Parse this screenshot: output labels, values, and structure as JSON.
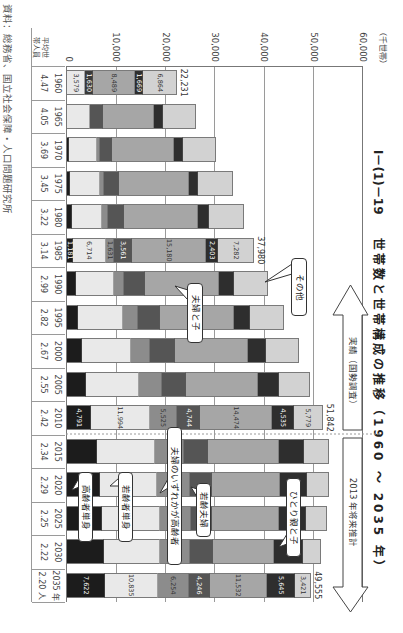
{
  "title": {
    "number": "Ⅰ－(1)－19",
    "text": "世帯数と世帯構成の推移（1960 ～ 2035 年）"
  },
  "axis": {
    "unit": "（千世帯）",
    "ticks": [
      "60,000",
      "50,000",
      "40,000",
      "30,000",
      "20,000",
      "10,000",
      "0"
    ]
  },
  "periods": {
    "actual": "実績（国勢調査）",
    "projection": "2013 年将来推計"
  },
  "callouts": {
    "other": "その他",
    "couple_with_children": "夫婦と子",
    "either_elderly_couple": "夫婦のいずれかが高齢者",
    "young_single": "若齢者単身",
    "young_couple": "若齢夫婦",
    "single_parent": "ひとり親と子",
    "elderly_single": "高齢者単身"
  },
  "table": {
    "header_line1": "平均世",
    "header_line2": "帯人員",
    "years": [
      "1960",
      "1965",
      "1970",
      "1975",
      "1980",
      "1985",
      "1990",
      "1995",
      "2000",
      "2005",
      "2010",
      "2015",
      "2020",
      "2025",
      "2030",
      "2035 年"
    ],
    "avg_size": [
      "4.47",
      "4.05",
      "3.69",
      "3.45",
      "3.22",
      "3.14",
      "2.99",
      "2.82",
      "2.67",
      "2.55",
      "2.42",
      "2.34",
      "2.29",
      "2.25",
      "2.22",
      "2.20 人"
    ]
  },
  "source": "資料：総務省、国立社会保障・人口問題研究所",
  "chart_data": {
    "type": "bar",
    "stacked": true,
    "title": "Ⅰ－(1)－19 世帯数と世帯構成の推移（1960 ～ 2035 年）",
    "xlabel": "",
    "ylabel": "千世帯",
    "ylim": [
      0,
      60000
    ],
    "yticks": [
      0,
      10000,
      20000,
      30000,
      40000,
      50000,
      60000
    ],
    "grid": true,
    "categories": [
      "1960",
      "1965",
      "1970",
      "1975",
      "1980",
      "1985",
      "1990",
      "1995",
      "2000",
      "2005",
      "2010",
      "2015",
      "2020",
      "2025",
      "2030",
      "2035"
    ],
    "series": [
      {
        "name": "高齢者単身",
        "color": "#1c1c1c",
        "values": [
          null,
          null,
          470,
          680,
          1010,
          1181,
          1760,
          2230,
          3110,
          3920,
          4791,
          6080,
          6760,
          7100,
          7440,
          7622
        ]
      },
      {
        "name": "若齢者単身",
        "color": "#e9e9e9",
        "values": [
          null,
          null,
          5610,
          5950,
          6080,
          6714,
          7710,
          9060,
          9800,
          10610,
          11994,
          11830,
          11490,
          11700,
          11360,
          10835
        ]
      },
      {
        "name": "夫婦のいずれかが高齢者",
        "color": "#8c8c8c",
        "values": [
          null,
          null,
          680,
          810,
          1280,
          1631,
          2160,
          3040,
          3990,
          4730,
          5525,
          5750,
          6620,
          6420,
          6220,
          6254
        ]
      },
      {
        "name": "若齢夫婦",
        "color": "#555555",
        "values": [
          null,
          null,
          2370,
          3110,
          3180,
          3561,
          4260,
          4600,
          5000,
          4930,
          4744,
          4930,
          4530,
          4190,
          4600,
          4246
        ]
      },
      {
        "name": "夫婦と子",
        "color": "#a6a6a6",
        "values": [
          8489,
          10480,
          12500,
          14200,
          15080,
          15180,
          14940,
          15010,
          14800,
          14600,
          14474,
          14330,
          13860,
          13650,
          12370,
          11532
        ]
      },
      {
        "name": "ひとり親と子",
        "color": "#2e2e2e",
        "values": [
          1669,
          1690,
          1830,
          1890,
          2160,
          2403,
          2970,
          3180,
          3720,
          4260,
          4535,
          5140,
          5410,
          5480,
          5810,
          5645
        ]
      },
      {
        "name": "その他",
        "color": "#d2d2d2",
        "values": [
          6864,
          6830,
          6760,
          6960,
          7030,
          7282,
          6960,
          6900,
          6620,
          6220,
          5779,
          5000,
          4460,
          4190,
          3720,
          3421
        ]
      }
    ],
    "early_segments": {
      "1960": [
        {
          "value": 3579,
          "color": "#e9e9e9"
        },
        {
          "value": 1630,
          "color": "#3a3a3a"
        }
      ],
      "1965": [
        {
          "value": 4730,
          "color": "#e9e9e9"
        },
        {
          "value": 2500,
          "color": "#555555"
        }
      ]
    },
    "labeled_years": [
      "1960",
      "1985",
      "2010",
      "2035"
    ],
    "totals": {
      "1960": "22,231",
      "1985": "37,980",
      "2010": "51,842",
      "2035": "49,555"
    },
    "avg_household_size": [
      4.47,
      4.05,
      3.69,
      3.45,
      3.22,
      3.14,
      2.99,
      2.82,
      2.67,
      2.55,
      2.42,
      2.34,
      2.29,
      2.25,
      2.22,
      2.2
    ],
    "periods": [
      {
        "label": "実績（国勢調査）",
        "from": "1960",
        "to": "2010"
      },
      {
        "label": "2013 年将来推計",
        "from": "2015",
        "to": "2035"
      }
    ]
  }
}
